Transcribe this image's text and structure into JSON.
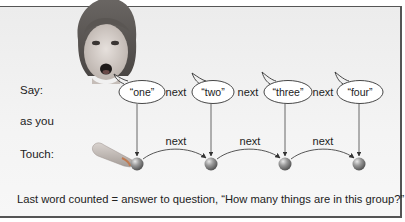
{
  "labels": {
    "say": "Say:",
    "as_you": "as you",
    "touch": "Touch:"
  },
  "bubbles": [
    {
      "text": "“one”"
    },
    {
      "text": "“two”"
    },
    {
      "text": "“three”"
    },
    {
      "text": "“four”"
    }
  ],
  "say_connectors": [
    "next",
    "next",
    "next"
  ],
  "touch_connectors": [
    "next",
    "next",
    "next"
  ],
  "caption": "Last word counted = answer to question, “How many things are in this group?”",
  "colors": {
    "panel_border": "#555555",
    "ball": "#8a8a8a",
    "arrow": "#333333"
  }
}
